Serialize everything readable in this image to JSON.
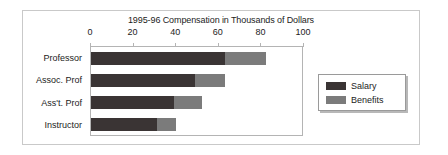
{
  "chart_data": {
    "type": "bar",
    "orientation": "horizontal",
    "stacked": true,
    "title": "1995-96 Compensation in Thousands of Dollars",
    "xlabel": "",
    "ylabel": "",
    "xlim": [
      0,
      100
    ],
    "xticks": [
      0,
      20,
      40,
      60,
      80,
      100
    ],
    "xtick_labels": [
      "0",
      "20",
      "40",
      "60",
      "80",
      "100"
    ],
    "grid": false,
    "legend_position": "right",
    "categories": [
      "Professor",
      "Assoc. Prof",
      "Ass't. Prof",
      "Instructor"
    ],
    "series": [
      {
        "name": "Salary",
        "color": "#3a3434",
        "values": [
          63,
          49,
          39,
          31
        ]
      },
      {
        "name": "Benefits",
        "color": "#7b7b7b",
        "values": [
          19,
          14,
          13,
          9
        ]
      }
    ],
    "totals": [
      82,
      63,
      52,
      40
    ]
  },
  "legend": {
    "items": [
      {
        "label": "Salary"
      },
      {
        "label": "Benefits"
      }
    ]
  }
}
